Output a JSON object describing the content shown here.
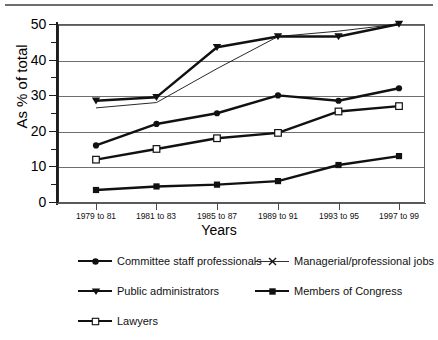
{
  "chart_data": {
    "type": "line",
    "title": "",
    "xlabel": "Years",
    "ylabel": "As % of total",
    "ylim": [
      0,
      50
    ],
    "yticks": [
      0,
      10,
      20,
      30,
      40,
      50
    ],
    "yticks_minor": [
      5,
      15,
      25,
      35,
      45
    ],
    "grid": "horizontal major gridlines",
    "legend_position": "below plot, two columns",
    "categories": [
      "1979 to 81",
      "1981 to 83",
      "1985 to 87",
      "1989 to 91",
      "1993 to 95",
      "1997 to 99"
    ],
    "series": [
      {
        "name": "Committee staff professionals",
        "marker": "filled-circle",
        "line": "thick-solid",
        "values": [
          16,
          22,
          25,
          30,
          28.5,
          32
        ]
      },
      {
        "name": "Managerial/professional jobs",
        "marker": "x-cross",
        "line": "thin-solid",
        "values": [
          26.5,
          28,
          37.5,
          46.5,
          48,
          50
        ]
      },
      {
        "name": "Public administrators",
        "marker": "filled-triangle-down",
        "line": "thick-solid",
        "values": [
          28.5,
          29.5,
          43.5,
          46.5,
          46.5,
          50
        ]
      },
      {
        "name": "Members of Congress",
        "marker": "filled-square",
        "line": "thick-solid",
        "values": [
          3.5,
          4.5,
          5,
          6,
          10.5,
          13
        ]
      },
      {
        "name": "Lawyers",
        "marker": "open-square",
        "line": "thick-solid",
        "values": [
          12,
          15,
          18,
          19.5,
          25.5,
          27
        ]
      }
    ]
  },
  "axis": {
    "y_title": "As % of total",
    "x_title": "Years",
    "y_tick_labels": [
      "0",
      "10",
      "20",
      "30",
      "40",
      "50"
    ],
    "x_tick_labels": [
      "1979 to 81",
      "1981 to 83",
      "1985 to 87",
      "1989 to 91",
      "1993 to 95",
      "1997 to 99"
    ]
  },
  "legend": {
    "items": [
      {
        "label": "Committee staff professionals",
        "marker": "filled-circle"
      },
      {
        "label": "Managerial/professional jobs",
        "marker": "x-cross"
      },
      {
        "label": "Public administrators",
        "marker": "filled-triangle-down"
      },
      {
        "label": "Members of Congress",
        "marker": "filled-square"
      },
      {
        "label": "Lawyers",
        "marker": "open-square"
      }
    ]
  },
  "colors": {
    "line": "#111111",
    "grid": "#6e6e6e",
    "axis": "#1d1d1d",
    "background": "#ffffff"
  }
}
